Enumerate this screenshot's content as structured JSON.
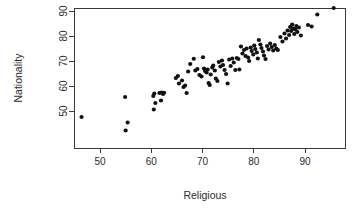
{
  "chart_data": {
    "type": "scatter",
    "title": "",
    "xlabel": "Religious",
    "ylabel": "Nationality",
    "xlim": [
      44,
      97
    ],
    "ylim": [
      41,
      92
    ],
    "grid": false,
    "legend": null,
    "xticks": [
      50,
      60,
      70,
      80,
      90
    ],
    "yticks": [
      50,
      60,
      70,
      80,
      90
    ],
    "xtick_labels": [
      "50",
      "60",
      "70",
      "80",
      "90"
    ],
    "ytick_labels": [
      "50",
      "60",
      "70",
      "80",
      "90"
    ],
    "point_color": "#111111",
    "point_radius": 2.1,
    "axis_color": "#3a3a3a",
    "text_color": "#2b2b2b",
    "background": "#ffffff",
    "n_points": 104,
    "points": [
      [
        46.4,
        47.6
      ],
      [
        54.9,
        55.6
      ],
      [
        55.4,
        45.4
      ],
      [
        55.0,
        42.2
      ],
      [
        60.4,
        56.0
      ],
      [
        60.6,
        57.0
      ],
      [
        60.5,
        50.6
      ],
      [
        60.8,
        53.2
      ],
      [
        61.6,
        57.2
      ],
      [
        62.0,
        57.4
      ],
      [
        62.3,
        56.8
      ],
      [
        62.5,
        57.3
      ],
      [
        61.9,
        54.2
      ],
      [
        64.8,
        63.2
      ],
      [
        65.2,
        64.0
      ],
      [
        65.4,
        61.0
      ],
      [
        66.0,
        62.2
      ],
      [
        66.3,
        59.6
      ],
      [
        66.6,
        60.2
      ],
      [
        66.9,
        57.2
      ],
      [
        67.2,
        65.8
      ],
      [
        67.6,
        68.8
      ],
      [
        68.3,
        70.9
      ],
      [
        68.6,
        66.2
      ],
      [
        69.0,
        66.8
      ],
      [
        69.4,
        64.4
      ],
      [
        69.8,
        63.8
      ],
      [
        70.1,
        71.5
      ],
      [
        70.3,
        67.0
      ],
      [
        70.5,
        66.0
      ],
      [
        70.8,
        65.4
      ],
      [
        71.0,
        66.6
      ],
      [
        71.2,
        61.2
      ],
      [
        71.4,
        60.4
      ],
      [
        71.6,
        64.6
      ],
      [
        71.9,
        67.4
      ],
      [
        72.1,
        68.2
      ],
      [
        72.4,
        66.2
      ],
      [
        72.6,
        63.0
      ],
      [
        72.9,
        62.0
      ],
      [
        73.2,
        69.6
      ],
      [
        73.5,
        67.8
      ],
      [
        73.8,
        70.2
      ],
      [
        74.0,
        68.4
      ],
      [
        74.3,
        66.4
      ],
      [
        74.6,
        64.8
      ],
      [
        74.9,
        61.0
      ],
      [
        75.2,
        70.6
      ],
      [
        75.5,
        68.0
      ],
      [
        75.8,
        71.0
      ],
      [
        76.1,
        69.4
      ],
      [
        76.4,
        66.4
      ],
      [
        76.7,
        71.2
      ],
      [
        77.0,
        70.8
      ],
      [
        77.2,
        66.6
      ],
      [
        77.5,
        75.8
      ],
      [
        77.8,
        73.0
      ],
      [
        78.1,
        74.4
      ],
      [
        78.4,
        72.0
      ],
      [
        78.6,
        75.0
      ],
      [
        78.9,
        71.4
      ],
      [
        79.1,
        70.0
      ],
      [
        79.4,
        75.4
      ],
      [
        79.6,
        74.0
      ],
      [
        79.9,
        72.6
      ],
      [
        80.1,
        76.2
      ],
      [
        80.3,
        74.8
      ],
      [
        80.6,
        73.4
      ],
      [
        80.8,
        71.0
      ],
      [
        81.0,
        78.4
      ],
      [
        81.3,
        76.6
      ],
      [
        81.5,
        75.2
      ],
      [
        81.8,
        73.8
      ],
      [
        82.0,
        72.2
      ],
      [
        82.3,
        70.8
      ],
      [
        82.6,
        76.0
      ],
      [
        82.9,
        74.6
      ],
      [
        83.2,
        77.0
      ],
      [
        83.5,
        75.6
      ],
      [
        83.8,
        74.2
      ],
      [
        84.1,
        76.4
      ],
      [
        84.4,
        75.0
      ],
      [
        84.7,
        74.4
      ],
      [
        85.2,
        79.6
      ],
      [
        85.6,
        77.8
      ],
      [
        86.0,
        81.0
      ],
      [
        86.3,
        79.0
      ],
      [
        86.6,
        82.2
      ],
      [
        86.9,
        80.4
      ],
      [
        87.1,
        83.6
      ],
      [
        87.3,
        82.0
      ],
      [
        87.5,
        84.6
      ],
      [
        87.7,
        83.0
      ],
      [
        87.9,
        80.8
      ],
      [
        88.1,
        82.6
      ],
      [
        88.3,
        84.0
      ],
      [
        88.5,
        81.6
      ],
      [
        88.8,
        83.4
      ],
      [
        89.2,
        80.2
      ],
      [
        90.6,
        84.4
      ],
      [
        91.3,
        83.8
      ],
      [
        92.4,
        88.6
      ],
      [
        95.6,
        91.2
      ]
    ]
  }
}
